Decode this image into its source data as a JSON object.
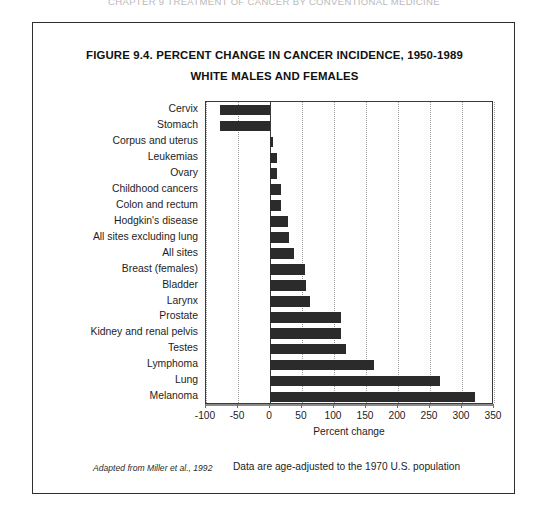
{
  "page": {
    "running_header": "CHAPTER 9  TREATMENT OF CANCER BY CONVENTIONAL MEDICINE"
  },
  "figure": {
    "title": "FIGURE 9.4.  PERCENT CHANGE IN CANCER INCIDENCE, 1950-1989",
    "subtitle": "WHITE MALES AND FEMALES",
    "source_note": "Adapted from Miller et al., 1992",
    "data_note": "Data are age-adjusted to the 1970 U.S. population"
  },
  "chart_data": {
    "type": "bar",
    "orientation": "horizontal",
    "title": "FIGURE 9.4.  PERCENT CHANGE IN CANCER INCIDENCE, 1950-1989 WHITE MALES AND FEMALES",
    "xlabel": "Percent change",
    "ylabel": "",
    "xlim": [
      -100,
      350
    ],
    "xticks": [
      -100,
      -50,
      0,
      50,
      100,
      150,
      200,
      250,
      300,
      350
    ],
    "xtick_labels": [
      "-100",
      "-50",
      "0",
      "50",
      "100",
      "150",
      "200",
      "250",
      "300",
      "350"
    ],
    "grid": true,
    "legend": "none",
    "bar_color": "#2b2b2b",
    "categories": [
      "Cervix",
      "Stomach",
      "Corpus and uterus",
      "Leukemias",
      "Ovary",
      "Childhood cancers",
      "Colon and rectum",
      "Hodgkin's disease",
      "All sites excluding lung",
      "All sites",
      "Breast (females)",
      "Bladder",
      "Larynx",
      "Prostate",
      "Kidney and renal pelvis",
      "Testes",
      "Lymphoma",
      "Lung",
      "Melanoma"
    ],
    "values": [
      -78,
      -78,
      4,
      11,
      11,
      17,
      17,
      28,
      30,
      37,
      54,
      56,
      62,
      111,
      111,
      118,
      162,
      265,
      321
    ]
  }
}
